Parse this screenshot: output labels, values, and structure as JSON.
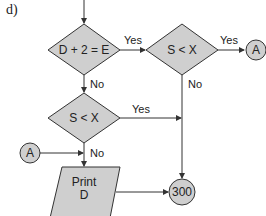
{
  "figure_label": "d)",
  "nodes": {
    "decision1": {
      "text": "D + 2 = E"
    },
    "decision2": {
      "text": "S < X"
    },
    "decision3": {
      "text": "S < X"
    },
    "connector_a_right": {
      "text": "A"
    },
    "connector_a_left": {
      "text": "A"
    },
    "print": {
      "line1": "Print",
      "line2": "D"
    },
    "terminal": {
      "text": "300"
    }
  },
  "edges": {
    "d1_yes": "Yes",
    "d1_no": "No",
    "d2_yes": "Yes",
    "d2_no": "No",
    "d3_yes": "Yes",
    "a_to_print_no": "No"
  },
  "colors": {
    "fill": "#cfcfcf",
    "stroke": "#333333",
    "background": "#ffffff"
  }
}
